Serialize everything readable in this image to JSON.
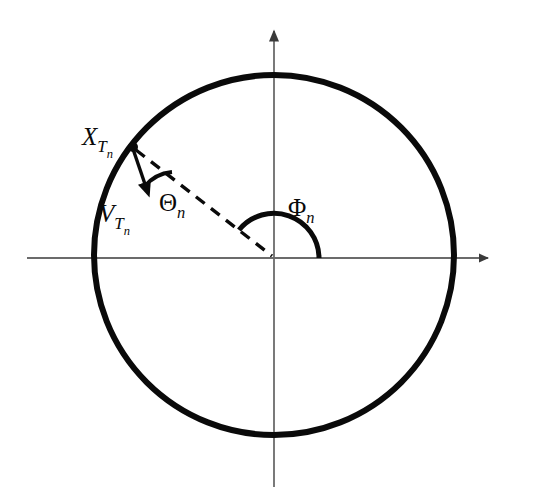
{
  "figure": {
    "type": "geometric-diagram",
    "title": "",
    "background_color": "#ffffff",
    "ink_color": "#0a0a0a",
    "axis_color": "#6b6b6b"
  },
  "labels": {
    "position_vector": {
      "base": "X",
      "sub": "T",
      "subsub": "n",
      "full": "X_{T_n}",
      "x": 82,
      "y": 145
    },
    "velocity_vector": {
      "base": "V",
      "sub": "T",
      "subsub": "n",
      "full": "V_{T_n}",
      "x": 99,
      "y": 222
    },
    "theta_angle": {
      "base": "Θ",
      "sub": "n",
      "full": "Θ_n",
      "x": 159,
      "y": 211
    },
    "phi_angle": {
      "base": "Φ",
      "sub": "n",
      "full": "Φ_n",
      "x": 288,
      "y": 216
    }
  },
  "geometry": {
    "origin": {
      "x": 274,
      "y": 258
    },
    "circle": {
      "cx": 274,
      "cy": 255,
      "r": 180,
      "stroke_width": 6
    },
    "x_axis": {
      "x1": 27,
      "y1": 258,
      "x2": 500,
      "y2": 258,
      "arrow_at": "end"
    },
    "y_axis": {
      "x1": 274,
      "y1": 20,
      "x2": 274,
      "y2": 487,
      "arrow_at": "start"
    },
    "point_on_circle": {
      "x": 133,
      "y": 147,
      "dot_r": 5
    },
    "chord_dashed": {
      "x1": 133,
      "y1": 147,
      "x2": 274,
      "y2": 258
    },
    "velocity_arrow": {
      "x1": 133,
      "y1": 149,
      "x2": 150,
      "y2": 198
    },
    "theta_arc": {
      "center_x": 133,
      "center_y": 147,
      "r": 42
    },
    "phi_arc": {
      "center_x": 274,
      "center_y": 258,
      "r": 45
    }
  }
}
